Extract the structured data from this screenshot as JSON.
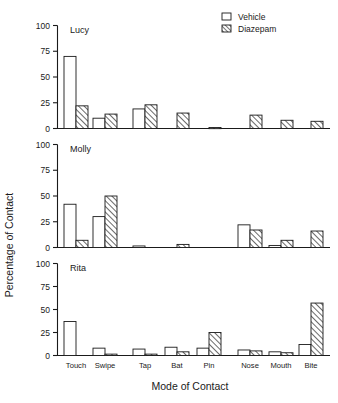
{
  "chart_data": {
    "type": "bar",
    "title": "",
    "xlabel": "Mode of Contact",
    "ylabel": "Percentage of Contact",
    "ylim": [
      0,
      100
    ],
    "yticks": [
      0,
      25,
      50,
      75,
      100
    ],
    "ytick_labels": [
      "0",
      "25",
      "50",
      "75",
      "100"
    ],
    "grid": false,
    "legend_position": "top-right",
    "categories": [
      "Touch",
      "Swipe",
      "Tap",
      "Bat",
      "Pin",
      "Nose",
      "Mouth",
      "Bite"
    ],
    "series_names": [
      "Vehicle",
      "Diazepam"
    ],
    "panels": [
      {
        "label": "Lucy",
        "series": [
          {
            "name": "Vehicle",
            "values": [
              70,
              10,
              19,
              0,
              0,
              0,
              0,
              0
            ]
          },
          {
            "name": "Diazepam",
            "values": [
              22,
              14,
              23,
              15,
              1,
              13,
              8,
              7
            ]
          }
        ]
      },
      {
        "label": "Molly",
        "series": [
          {
            "name": "Vehicle",
            "values": [
              42,
              30,
              1.5,
              0,
              0,
              22,
              2,
              0
            ]
          },
          {
            "name": "Diazepam",
            "values": [
              7,
              50,
              0,
              3,
              0,
              17,
              7,
              16
            ]
          }
        ]
      },
      {
        "label": "Rita",
        "series": [
          {
            "name": "Vehicle",
            "values": [
              37,
              8,
              7,
              9,
              8,
              6,
              4,
              12
            ]
          },
          {
            "name": "Diazepam",
            "values": [
              0,
              1.5,
              1.5,
              4,
              25,
              5,
              3,
              57
            ]
          }
        ]
      }
    ]
  },
  "legend": {
    "items": [
      {
        "label": "Vehicle",
        "swatch": "open-square"
      },
      {
        "label": "Diazepam",
        "swatch": "hatched-square"
      }
    ]
  }
}
